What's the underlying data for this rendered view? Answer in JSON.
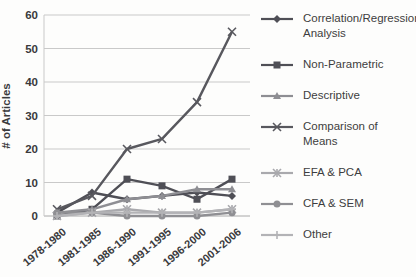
{
  "chart_data": {
    "type": "line",
    "title": "",
    "xlabel": "",
    "ylabel": "# of Articles",
    "ylim": [
      0,
      60
    ],
    "y_ticks": [
      0,
      10,
      20,
      30,
      40,
      50,
      60
    ],
    "grid": true,
    "legend_position": "right",
    "categories": [
      "1978-1980",
      "1981-1985",
      "1986-1990",
      "1991-1995",
      "1996-2000",
      "2001-2006"
    ],
    "series": [
      {
        "name": "Correlation/Regression Analysis",
        "marker": "diamond",
        "color": "#4f4f56",
        "values": [
          1,
          7,
          5,
          6,
          7,
          6
        ]
      },
      {
        "name": "Non-Parametric",
        "marker": "square",
        "color": "#4f4f56",
        "values": [
          0,
          2,
          11,
          9,
          5,
          11
        ]
      },
      {
        "name": "Descriptive",
        "marker": "triangle",
        "color": "#8e8e93",
        "values": [
          1,
          2,
          5,
          6,
          8,
          8
        ]
      },
      {
        "name": "Comparison of Means",
        "marker": "x",
        "color": "#58585e",
        "values": [
          2,
          6,
          20,
          23,
          34,
          55
        ]
      },
      {
        "name": "EFA & PCA",
        "marker": "asterisk",
        "color": "#a9a9ad",
        "values": [
          0,
          1,
          2,
          1,
          1,
          2
        ]
      },
      {
        "name": "CFA & SEM",
        "marker": "circle",
        "color": "#8f8f93",
        "values": [
          1,
          1,
          0,
          0,
          0,
          1
        ]
      },
      {
        "name": "Other",
        "marker": "plus",
        "color": "#b3b3b6",
        "values": [
          0,
          1,
          1,
          1,
          1,
          2
        ]
      }
    ],
    "colors": {
      "gridline": "#c9c9c9",
      "axis": "#a8a8a8",
      "tick_text": "#3a3a3c"
    }
  }
}
